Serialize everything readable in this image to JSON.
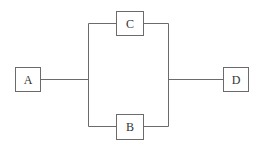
{
  "diagram": {
    "type": "block-diagram",
    "nodes": [
      {
        "id": "A",
        "label": "A"
      },
      {
        "id": "C",
        "label": "C"
      },
      {
        "id": "B",
        "label": "B"
      },
      {
        "id": "D",
        "label": "D"
      }
    ],
    "edges": [
      {
        "from": "A",
        "to": "C"
      },
      {
        "from": "A",
        "to": "B"
      },
      {
        "from": "C",
        "to": "D"
      },
      {
        "from": "B",
        "to": "D"
      }
    ],
    "colors": {
      "line": "#6b6b6b",
      "text": "#333333",
      "background": "#ffffff"
    }
  }
}
